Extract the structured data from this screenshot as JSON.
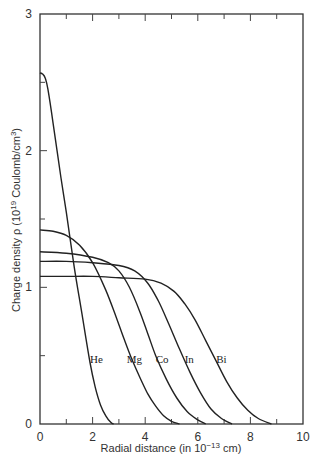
{
  "chart_data": {
    "type": "line",
    "title": "",
    "xlabel": "Radial distance (in 10^-13 cm)",
    "xlabel_parts": {
      "pre": "Radial distance (in 10",
      "sup": "−13",
      "post": " cm)"
    },
    "ylabel": "Charge density ρ (10^19 Coulomb/cm^3)",
    "ylabel_parts": {
      "pre": "Charge density ρ (10",
      "sup1": "19",
      "mid": " Coulomb/cm",
      "sup2": "3",
      "post": ")"
    },
    "xlim": [
      0,
      10
    ],
    "ylim": [
      0,
      3
    ],
    "x_ticks_major": [
      0,
      2,
      4,
      6,
      8,
      10
    ],
    "x_ticks_minor": [
      1,
      3,
      5,
      7,
      9
    ],
    "y_ticks_major": [
      0,
      1,
      2,
      3
    ],
    "y_ticks_minor": [
      0.5,
      1.5,
      2.5
    ],
    "grid": false,
    "legend": "inline labels",
    "series": [
      {
        "name": "He",
        "label_pos": [
          1.9,
          0.45
        ],
        "x": [
          0,
          0.1,
          0.2,
          0.3,
          0.5,
          0.8,
          1.0,
          1.3,
          1.6,
          1.9,
          2.1,
          2.3,
          2.5,
          2.7,
          2.8
        ],
        "y": [
          2.57,
          2.56,
          2.53,
          2.45,
          2.2,
          1.8,
          1.55,
          1.15,
          0.8,
          0.45,
          0.27,
          0.14,
          0.06,
          0.01,
          0.0
        ]
      },
      {
        "name": "Mg",
        "label_pos": [
          3.3,
          0.45
        ],
        "x": [
          0,
          0.5,
          1.0,
          1.5,
          2.0,
          2.5,
          2.9,
          3.2,
          3.5,
          3.8,
          4.1,
          4.4,
          4.7,
          5.0,
          5.3
        ],
        "y": [
          1.42,
          1.41,
          1.38,
          1.31,
          1.18,
          0.98,
          0.78,
          0.62,
          0.47,
          0.34,
          0.22,
          0.13,
          0.06,
          0.02,
          0.0
        ]
      },
      {
        "name": "Co",
        "label_pos": [
          4.4,
          0.45
        ],
        "x": [
          0,
          1.0,
          2.0,
          2.6,
          3.0,
          3.4,
          3.8,
          4.1,
          4.4,
          4.8,
          5.2,
          5.6,
          6.0,
          6.3
        ],
        "y": [
          1.26,
          1.25,
          1.22,
          1.18,
          1.12,
          1.0,
          0.82,
          0.66,
          0.5,
          0.33,
          0.19,
          0.09,
          0.03,
          0.0
        ]
      },
      {
        "name": "In",
        "label_pos": [
          5.5,
          0.45
        ],
        "x": [
          0,
          1.0,
          2.0,
          3.0,
          3.6,
          4.1,
          4.5,
          4.9,
          5.3,
          5.7,
          6.1,
          6.5,
          6.9,
          7.3
        ],
        "y": [
          1.19,
          1.19,
          1.18,
          1.16,
          1.12,
          1.03,
          0.9,
          0.73,
          0.55,
          0.38,
          0.23,
          0.11,
          0.04,
          0.0
        ]
      },
      {
        "name": "Bi",
        "label_pos": [
          6.7,
          0.45
        ],
        "x": [
          0,
          1.0,
          2.0,
          3.0,
          4.0,
          4.6,
          5.1,
          5.5,
          5.9,
          6.3,
          6.7,
          7.1,
          7.5,
          7.9,
          8.3,
          8.8
        ],
        "y": [
          1.08,
          1.08,
          1.08,
          1.07,
          1.06,
          1.03,
          0.97,
          0.88,
          0.76,
          0.61,
          0.46,
          0.31,
          0.19,
          0.1,
          0.04,
          0.0
        ]
      }
    ]
  }
}
